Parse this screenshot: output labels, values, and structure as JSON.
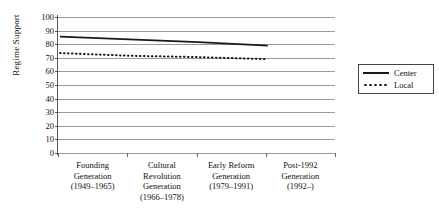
{
  "chart_data": {
    "type": "line",
    "title": "",
    "xlabel": "",
    "ylabel": "Regime Support",
    "ylim": [
      0,
      100
    ],
    "ytick_step": 10,
    "yticks": [
      100,
      90,
      80,
      70,
      60,
      50,
      40,
      30,
      20,
      10,
      0
    ],
    "grid": true,
    "legend_position": "right",
    "categories": [
      "Founding Generation (1949–1965)",
      "Cultural Revolution Generation (1966–1978)",
      "Early Reform Generation (1979–1991)",
      "Post-1992 Generation (1992–)"
    ],
    "category_lines": [
      [
        "Founding",
        "Generation",
        "(1949–1965)"
      ],
      [
        "Cultural",
        "Revolution",
        "Generation",
        "(1966–1978)"
      ],
      [
        "Early Reform",
        "Generation",
        "(1979–1991)"
      ],
      [
        "Post-1992",
        "Generation",
        "(1992–)"
      ]
    ],
    "series": [
      {
        "name": "Center",
        "style": "solid",
        "color": "#1a1a1a",
        "values": [
          85.5,
          83.5,
          81.5,
          79.0
        ]
      },
      {
        "name": "Local",
        "style": "dotted",
        "color": "#1a1a1a",
        "values": [
          73.5,
          71.5,
          70.5,
          69.0
        ]
      }
    ]
  },
  "legend": {
    "items": [
      {
        "label": "Center"
      },
      {
        "label": "Local"
      }
    ]
  },
  "colors": {
    "grid": "#9a9a9a",
    "axis": "#555555",
    "ink": "#1a1a1a"
  }
}
